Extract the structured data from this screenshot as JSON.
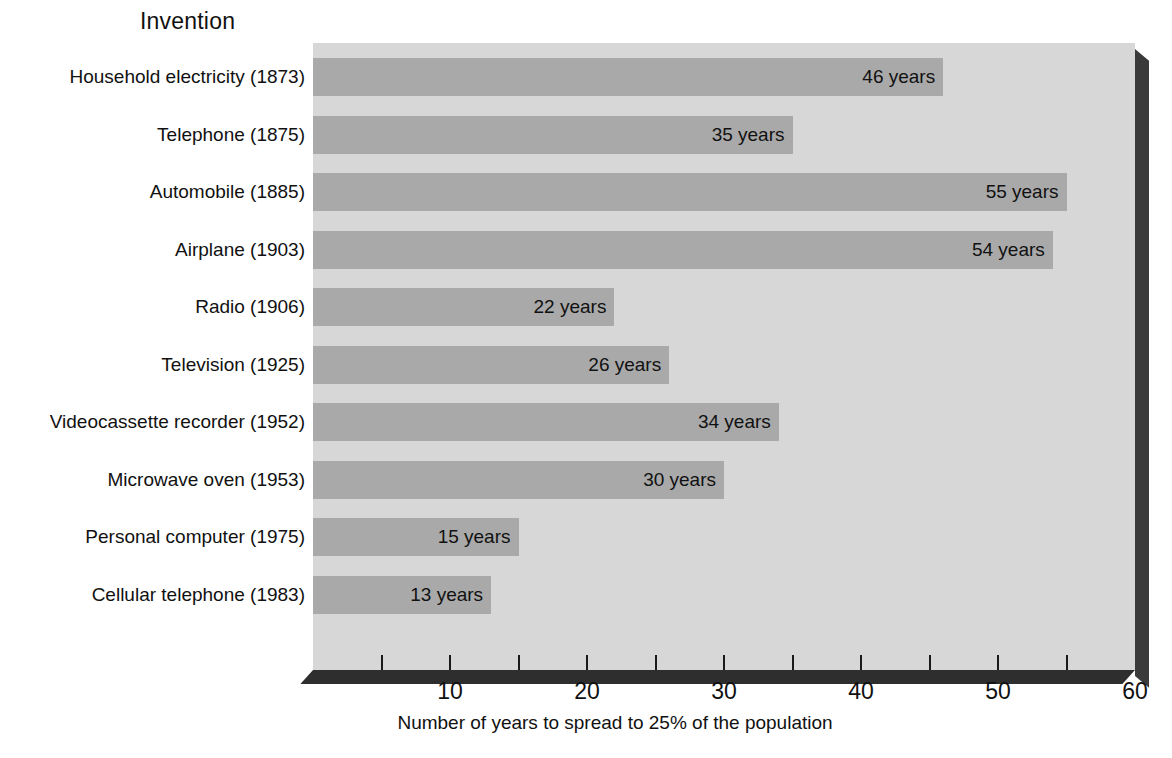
{
  "chart_data": {
    "type": "bar",
    "orientation": "horizontal",
    "title": "",
    "ylabel": "Invention",
    "xlabel": "Number of years to spread to 25% of the population",
    "categories": [
      "Household electricity (1873)",
      "Telephone (1875)",
      "Automobile (1885)",
      "Airplane (1903)",
      "Radio (1906)",
      "Television (1925)",
      "Videocassette recorder (1952)",
      "Microwave oven (1953)",
      "Personal computer (1975)",
      "Cellular telephone (1983)"
    ],
    "values": [
      46,
      35,
      55,
      54,
      22,
      26,
      34,
      30,
      15,
      13
    ],
    "value_labels": [
      "46 years",
      "35 years",
      "55 years",
      "54 years",
      "22 years",
      "26 years",
      "34 years",
      "30 years",
      "15 years",
      "13 years"
    ],
    "unit": "years",
    "xlim": [
      0,
      60
    ],
    "xticks": [
      10,
      20,
      30,
      40,
      50,
      60
    ],
    "xtick_labels": [
      "10",
      "20",
      "30",
      "40",
      "50",
      "60"
    ],
    "minor_tick_values": [
      5,
      10,
      15,
      20,
      25,
      30,
      35,
      40,
      45,
      50,
      55
    ],
    "grid": false,
    "legend": "none",
    "colors": {
      "bar": "#a9a9a9",
      "plot_background": "#d7d7d7",
      "page_background": "#ffffff",
      "text": "#111111",
      "axis_shadow": "#2e2e2e"
    }
  },
  "axis": {
    "y_title": "Invention",
    "x_title": "Number of years to spread to 25% of the population"
  }
}
